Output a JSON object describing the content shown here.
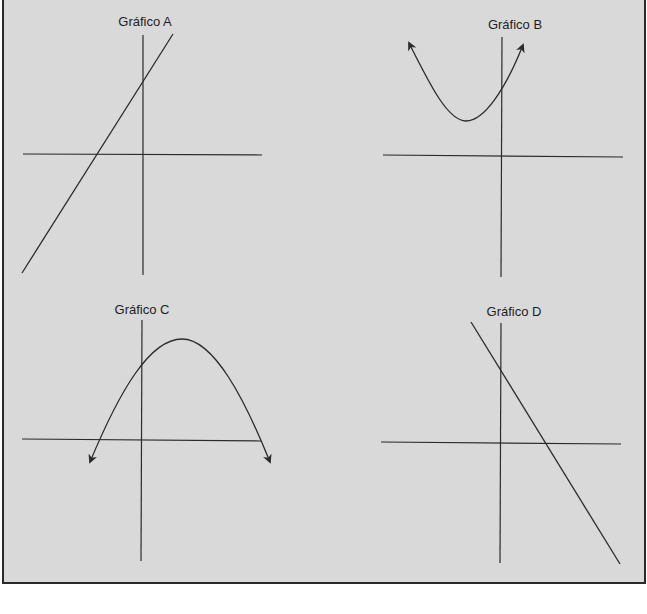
{
  "figure": {
    "panels": [
      {
        "id": "A",
        "title": "Gráfico A",
        "kind": "line",
        "slope": "positive",
        "description": "Straight line with positive slope, x-intercept negative, y-intercept positive"
      },
      {
        "id": "B",
        "title": "Gráfico B",
        "kind": "parabola",
        "opens": "up",
        "description": "Upward-opening parabola with vertex left of y-axis and above x-axis (no real roots), arrows at both ends"
      },
      {
        "id": "C",
        "title": "Gráfico C",
        "kind": "parabola",
        "opens": "down",
        "description": "Downward-opening parabola with vertex right of y-axis, two x-intercepts (one negative, one positive), arrows at both ends"
      },
      {
        "id": "D",
        "title": "Gráfico D",
        "kind": "line",
        "slope": "negative",
        "description": "Straight line with negative slope, positive y-intercept and positive x-intercept"
      }
    ]
  },
  "colors": {
    "background": "#d9d9d9",
    "ink": "#2b2b2b",
    "border": "#2a2a2a"
  }
}
